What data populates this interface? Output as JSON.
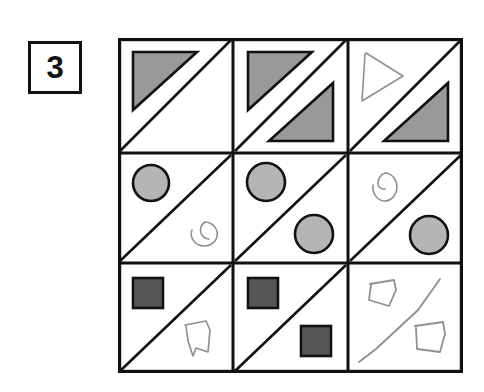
{
  "page": {
    "kind": "visual-analogy-matrix-puzzle",
    "background_color": "#ffffff"
  },
  "label": {
    "text": "3",
    "border_color": "#111111",
    "background_color": "#ffffff"
  },
  "palette": {
    "grid_line": "#111111",
    "diagonal_line": "#111111",
    "triangle_fill": "#999999",
    "triangle_stroke": "#111111",
    "circle_fill": "#b5b5b5",
    "circle_stroke": "#111111",
    "square_fill": "#565656",
    "square_stroke": "#111111",
    "handdrawn_stroke": "#8f8f95"
  },
  "matrix": {
    "rows": 3,
    "cols": 3,
    "cell_diagonal": "top-right-to-bottom-left",
    "cells": [
      {
        "index": 1,
        "row": 1,
        "col": 1,
        "row_shape": "triangle",
        "upper_left_half": {
          "shape": "triangle",
          "style": "filled",
          "fill": "#999999"
        },
        "lower_right_half": {
          "shape": "none"
        }
      },
      {
        "index": 2,
        "row": 1,
        "col": 2,
        "row_shape": "triangle",
        "upper_left_half": {
          "shape": "triangle",
          "style": "filled",
          "fill": "#999999"
        },
        "lower_right_half": {
          "shape": "triangle",
          "style": "filled",
          "fill": "#999999"
        }
      },
      {
        "index": 3,
        "row": 1,
        "col": 3,
        "row_shape": "triangle",
        "upper_left_half": {
          "shape": "triangle",
          "style": "hand-drawn",
          "fill": "none"
        },
        "lower_right_half": {
          "shape": "triangle",
          "style": "filled",
          "fill": "#999999"
        }
      },
      {
        "index": 4,
        "row": 2,
        "col": 1,
        "row_shape": "circle",
        "upper_left_half": {
          "shape": "circle",
          "style": "filled",
          "fill": "#b5b5b5"
        },
        "lower_right_half": {
          "shape": "circle",
          "style": "hand-drawn",
          "fill": "none"
        }
      },
      {
        "index": 5,
        "row": 2,
        "col": 2,
        "row_shape": "circle",
        "upper_left_half": {
          "shape": "circle",
          "style": "filled",
          "fill": "#b5b5b5"
        },
        "lower_right_half": {
          "shape": "circle",
          "style": "filled",
          "fill": "#b5b5b5"
        }
      },
      {
        "index": 6,
        "row": 2,
        "col": 3,
        "row_shape": "circle",
        "upper_left_half": {
          "shape": "circle",
          "style": "hand-drawn",
          "fill": "none"
        },
        "lower_right_half": {
          "shape": "circle",
          "style": "filled",
          "fill": "#b5b5b5"
        }
      },
      {
        "index": 7,
        "row": 3,
        "col": 1,
        "row_shape": "square",
        "upper_left_half": {
          "shape": "square",
          "style": "filled",
          "fill": "#565656"
        },
        "lower_right_half": {
          "shape": "square",
          "style": "hand-drawn",
          "fill": "none"
        }
      },
      {
        "index": 8,
        "row": 3,
        "col": 2,
        "row_shape": "square",
        "upper_left_half": {
          "shape": "square",
          "style": "filled",
          "fill": "#565656"
        },
        "lower_right_half": {
          "shape": "square",
          "style": "filled",
          "fill": "#565656"
        }
      },
      {
        "index": 9,
        "row": 3,
        "col": 3,
        "row_shape": "square",
        "diagonal_style": "hand-drawn",
        "upper_left_half": {
          "shape": "square",
          "style": "hand-drawn",
          "fill": "none"
        },
        "lower_right_half": {
          "shape": "square",
          "style": "hand-drawn",
          "fill": "none"
        }
      }
    ]
  }
}
